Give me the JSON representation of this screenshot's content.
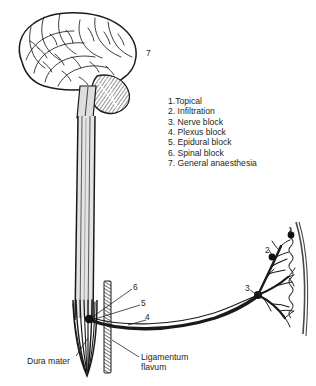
{
  "figure": {
    "background_color": "#ffffff",
    "ink_color": "#231f20"
  },
  "legend": {
    "items": [
      "1.Topical",
      "2. Infiltration",
      "3. Nerve block",
      "4. Plexus block",
      "5. Epidural block",
      "6. Spinal block",
      "7. General anaesthesia"
    ]
  },
  "callouts": {
    "dura_mater": "Dura mater",
    "ligamentum_flavum_line1": "Ligamentum",
    "ligamentum_flavum_line2": "flavum"
  },
  "markers": {
    "n1": "1",
    "n2": "2",
    "n3": "3",
    "n4": "4",
    "n5": "5",
    "n6": "6",
    "n7": "7"
  },
  "anatomy": {
    "brain": "brain-cerebrum",
    "cerebellum": "cerebellum",
    "spinal_cord": "spinal-cord",
    "cauda_equina": "cauda-equina",
    "dura": "dura-mater",
    "ligament": "ligamentum-flavum",
    "nerve_root": "spinal-nerve-root",
    "plexus": "nerve-plexus",
    "skin": "skin-surface"
  }
}
